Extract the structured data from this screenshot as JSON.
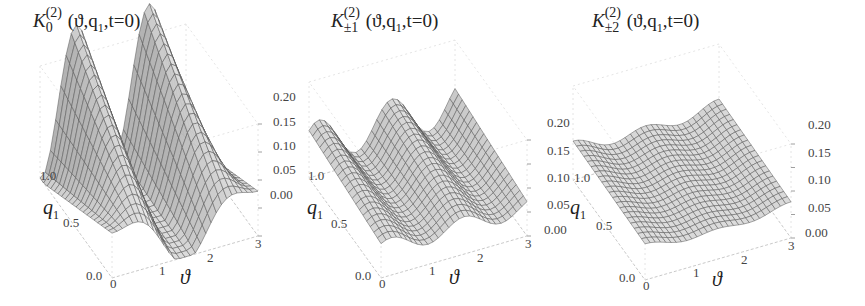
{
  "figure": {
    "panels": [
      {
        "id": "K0",
        "title": {
          "symbol": "K",
          "superscript": "(2)",
          "subscript": "0",
          "args": "(ϑ,q",
          "args_sub": "1",
          "args_tail": ",t=0)"
        },
        "z_ticks": [
          "0.20",
          "0.15",
          "0.10",
          "0.05",
          "0.00"
        ],
        "q_ticks": [
          "1.0",
          "0.5",
          "0.0"
        ],
        "theta_ticks": [
          "0",
          "1",
          "2",
          "3"
        ],
        "xlabel": "ϑ",
        "ylabel": "q",
        "ylabel_sub": "1"
      },
      {
        "id": "K±1",
        "title": {
          "symbol": "K",
          "superscript": "(2)",
          "subscript": "±1",
          "args": "(ϑ,q",
          "args_sub": "1",
          "args_tail": ",t=0)"
        },
        "z_ticks": [
          "0.20",
          "0.15",
          "0.10",
          "0.05",
          "0.00"
        ],
        "q_ticks": [
          "1.0",
          "0.5",
          "0.0"
        ],
        "theta_ticks": [
          "0",
          "1",
          "2",
          "3"
        ],
        "xlabel": "ϑ",
        "ylabel": "q",
        "ylabel_sub": "1"
      },
      {
        "id": "K±2",
        "title": {
          "symbol": "K",
          "superscript": "(2)",
          "subscript": "±2",
          "args": "(ϑ,q",
          "args_sub": "1",
          "args_tail": ",t=0)"
        },
        "z_ticks": [
          "0.20",
          "0.15",
          "0.10",
          "0.05",
          "0.00"
        ],
        "q_ticks": [
          "1.0",
          "0.5",
          "0.0"
        ],
        "theta_ticks": [
          "0",
          "1",
          "2",
          "3"
        ],
        "xlabel": "ϑ",
        "ylabel": "q",
        "ylabel_sub": "1"
      }
    ]
  },
  "chart_data": [
    {
      "type": "surface3d",
      "title": "K_0^(2)(ϑ,q_1,t=0)",
      "xlabel": "ϑ",
      "ylabel": "q_1",
      "zlabel": "",
      "xlim": [
        0,
        3.14
      ],
      "ylim": [
        0,
        1.0
      ],
      "zlim": [
        0,
        0.2
      ],
      "x_ticks": [
        0,
        1,
        2,
        3
      ],
      "y_ticks": [
        0.0,
        0.5,
        1.0
      ],
      "z_ticks": [
        0.0,
        0.05,
        0.1,
        0.15,
        0.2
      ],
      "description": "Large oscillation in ϑ (period ~π/2, two full peaks), amplitude largest near q1=1 (peaks ~0.20+), valleys near 0 at low q1; surface rises toward q1=1",
      "sample_profile_q1_1": {
        "theta": [
          0,
          0.4,
          0.8,
          1.2,
          1.6,
          2.0,
          2.4,
          2.8,
          3.14
        ],
        "K": [
          0.19,
          0.1,
          0.22,
          0.12,
          0.1,
          0.23,
          0.12,
          0.1,
          0.19
        ]
      },
      "sample_profile_q1_0": {
        "theta": [
          0,
          0.4,
          0.8,
          1.2,
          1.6,
          2.0,
          2.4,
          2.8,
          3.14
        ],
        "K": [
          0.02,
          0.08,
          0.03,
          0.1,
          0.01,
          0.1,
          0.03,
          0.08,
          0.02
        ]
      },
      "grid": true
    },
    {
      "type": "surface3d",
      "title": "K_±1^(2)(ϑ,q_1,t=0)",
      "xlabel": "ϑ",
      "ylabel": "q_1",
      "zlabel": "",
      "xlim": [
        0,
        3.14
      ],
      "ylim": [
        0,
        1.0
      ],
      "zlim": [
        0,
        0.2
      ],
      "x_ticks": [
        0,
        1,
        2,
        3
      ],
      "y_ticks": [
        0.0,
        0.5,
        1.0
      ],
      "z_ticks": [
        0.0,
        0.05,
        0.1,
        0.15,
        0.2
      ],
      "description": "Two ridges along ϑ, peaks ~0.13-0.15 near q1=1, values near 0.05-0.10 elsewhere",
      "sample_profile_q1_1": {
        "theta": [
          0,
          0.4,
          0.8,
          1.2,
          1.6,
          2.0,
          2.4,
          2.8,
          3.14
        ],
        "K": [
          0.07,
          0.14,
          0.07,
          0.05,
          0.07,
          0.15,
          0.08,
          0.05,
          0.07
        ]
      },
      "grid": true
    },
    {
      "type": "surface3d",
      "title": "K_±2^(2)(ϑ,q_1,t=0)",
      "xlabel": "ϑ",
      "ylabel": "q_1",
      "zlabel": "",
      "xlim": [
        0,
        3.14
      ],
      "ylim": [
        0,
        1.0
      ],
      "zlim": [
        0,
        0.2
      ],
      "x_ticks": [
        0,
        1,
        2,
        3
      ],
      "y_ticks": [
        0.0,
        0.5,
        1.0
      ],
      "z_ticks": [
        0.0,
        0.05,
        0.1,
        0.15,
        0.2
      ],
      "description": "Nearly flat surface with small ripples, values ~0.05-0.08",
      "sample_profile_q1_1": {
        "theta": [
          0,
          0.4,
          0.8,
          1.2,
          1.6,
          2.0,
          2.4,
          2.8,
          3.14
        ],
        "K": [
          0.07,
          0.06,
          0.08,
          0.06,
          0.08,
          0.06,
          0.08,
          0.06,
          0.07
        ]
      },
      "grid": true
    }
  ]
}
